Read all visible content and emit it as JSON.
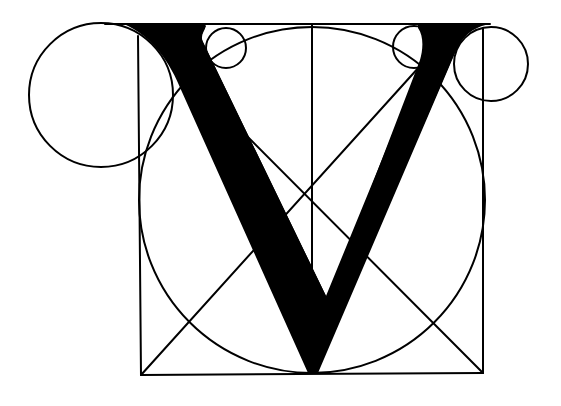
{
  "figure": {
    "letter": "V",
    "colors": {
      "ink": "#000000",
      "paper": "#ffffff"
    },
    "frame": {
      "x1": 140,
      "y1": 24,
      "x2": 483,
      "y2": 374
    },
    "center_vertical_x": 312,
    "diagonal_intersection": [
      311,
      203
    ],
    "circles": [
      {
        "name": "main-circle",
        "cx": 312,
        "cy": 200,
        "r": 173
      },
      {
        "name": "left-large-serif-circle",
        "cx": 101,
        "cy": 95,
        "r": 72
      },
      {
        "name": "left-small-serif-circle",
        "cx": 226,
        "cy": 48,
        "r": 20
      },
      {
        "name": "right-small-serif-circle",
        "cx": 414,
        "cy": 47,
        "r": 21
      },
      {
        "name": "right-serif-circle",
        "cx": 491,
        "cy": 64,
        "r": 37
      }
    ],
    "glyph": {
      "apex": [
        312,
        373
      ],
      "inner_notch": [
        320,
        305
      ],
      "thick_stroke_width": 40,
      "thin_stroke_width": 25
    }
  }
}
